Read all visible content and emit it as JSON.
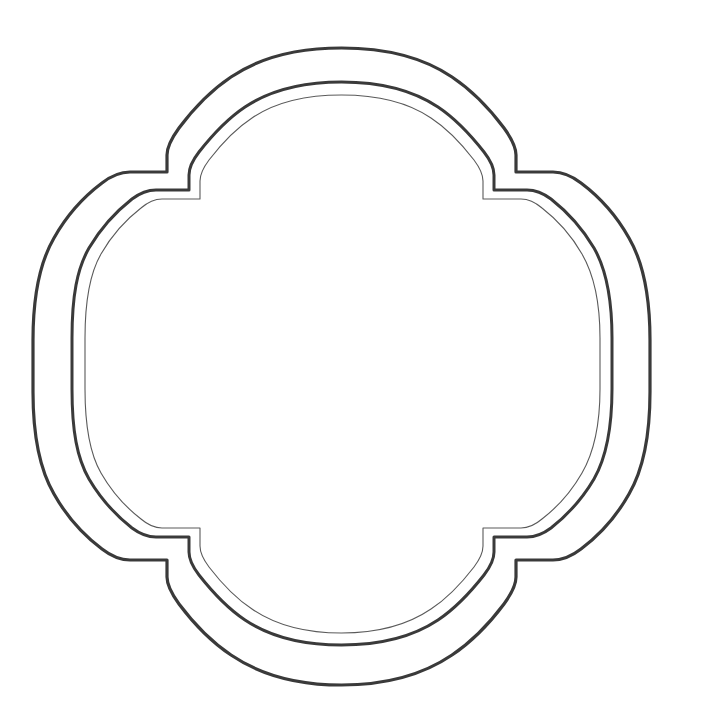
{
  "document": {
    "title": "Ornamental Frame Outline",
    "background_color": "#ffffff",
    "width": 701,
    "height": 725,
    "content_text": ""
  },
  "artwork": {
    "name": "decorative-quatrefoil-label-frame",
    "description": "Three nested scalloped ornamental border outlines forming a blank decorative label",
    "symmetry": "4-fold (horizontal and vertical mirror)",
    "ring_count": 3
  },
  "rings": [
    {
      "id": "outer-ring",
      "label": "Outer border",
      "stroke_color": "#3a3a3a",
      "stroke_width": 3.2,
      "bounds": {
        "x_min": 33,
        "x_max": 650,
        "y_min": 48,
        "y_max": 685
      },
      "path": "M 341.5 48 C 389 48 424 58 452 77 C 476 93 492 112 504 128 C 512 139 516 148 516 155 L 516 172 L 553 172 C 562 172 572 176 581 183 C 597 195 615 213 629 238 C 643 262 650 293 650 340 L 650 392 C 650 439 643 470 629 494 C 615 519 597 537 581 549 C 572 556 562 560 553 560 L 516 560 L 516 577 C 516 584 512 593 504 604 C 492 620 476 639 452 655 C 424 674 389 685 341.5 685 C 294 685 259 674 231 655 C 207 639 191 620 179 604 C 171 593 167 584 167 577 L 167 560 L 130 560 C 121 560 111 556 102 549 C 86 537 68 519 54 494 C 40 470 33 439 33 392 L 33 340 C 33 293 40 262 54 238 C 68 213 86 195 102 183 C 111 176 121 172 130 172 L 167 172 L 167 155 C 167 148 171 139 179 128 C 191 112 207 93 231 77 C 259 58 294 48 341.5 48 Z"
    },
    {
      "id": "middle-ring",
      "label": "Middle border",
      "stroke_color": "#3a3a3a",
      "stroke_width": 3.0,
      "bounds": {
        "x_min": 72,
        "x_max": 612,
        "y_min": 82,
        "y_max": 645
      },
      "path": "M 341.5 82 C 383 82 414 91 438 107 C 459 121 473 138 484 152 C 491 161 494 169 494 175 L 494 190 L 527 190 C 535 190 543 193 551 199 C 565 210 581 226 594 248 C 606 269 612 296 612 338 L 612 389 C 612 431 606 458 594 479 C 581 501 565 517 551 528 C 543 534 535 537 527 537 L 494 537 L 494 552 C 494 558 491 566 484 575 C 473 589 459 606 438 620 C 414 636 383 645 341.5 645 C 300 645 269 636 245 620 C 224 606 210 589 199 575 C 192 566 189 558 189 552 L 189 537 L 156 537 C 148 537 140 534 132 528 C 118 517 102 501 89 479 C 77 458 72 431 72 389 L 72 338 C 72 296 77 269 89 248 C 102 226 118 210 132 199 C 140 193 148 190 156 190 L 189 190 L 189 175 C 189 169 192 161 199 152 C 210 138 224 121 245 107 C 269 91 300 82 341.5 82 Z"
    },
    {
      "id": "inner-hairline-ring",
      "label": "Inner hairline border",
      "stroke_color": "#5a5a5a",
      "stroke_width": 1.1,
      "bounds": {
        "x_min": 85,
        "x_max": 600,
        "y_min": 95,
        "y_max": 633
      },
      "path": "M 341.5 95 C 380 95 409 103 431 118 C 451 131 464 147 474 160 C 480 168 483 175 483 181 L 483 199 L 521 199 C 528 199 535 202 542 208 C 555 218 570 233 582 254 C 593 273 600 299 600 338 L 600 389 C 600 428 593 454 582 473 C 570 494 555 509 542 519 C 535 525 528 528 521 528 L 483 528 L 483 546 C 483 552 480 559 474 567 C 464 580 451 596 431 609 C 409 624 380 633 341.5 633 C 303 633 274 624 252 609 C 232 596 219 580 209 567 C 203 559 200 552 200 546 L 200 528 L 162 528 C 155 528 148 525 141 519 C 128 509 113 494 101 473 C 90 454 85 428 85 389 L 85 338 C 85 299 90 273 101 254 C 113 233 128 218 141 208 C 148 202 155 199 162 199 L 200 199 L 200 181 C 200 175 203 168 209 160 C 219 147 232 131 252 118 C 274 103 303 95 341.5 95 Z"
    }
  ]
}
